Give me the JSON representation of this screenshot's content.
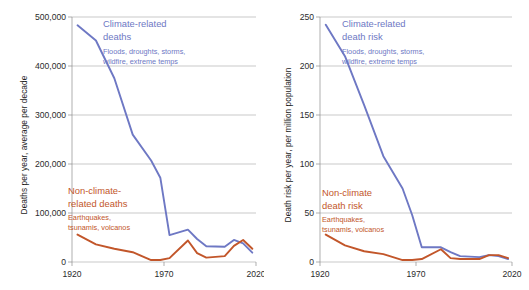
{
  "figure": {
    "background": "#ffffff",
    "colors": {
      "climate": "#6E78C4",
      "nonclimate": "#C2562A",
      "grid": "#a6a6a6",
      "axis": "#8c8c8c",
      "text": "#2b2b2b"
    }
  },
  "chart_data": [
    {
      "type": "line",
      "title": "",
      "xlabel": "",
      "ylabel": "Deaths per year, average per decade",
      "xlim": [
        1920,
        2020
      ],
      "ylim": [
        0,
        500000
      ],
      "xticks": [
        1920,
        1970,
        2020
      ],
      "xticklabels": [
        "1920",
        "1970",
        "2020"
      ],
      "yticks": [
        0,
        100000,
        200000,
        300000,
        400000,
        500000
      ],
      "yticklabels": [
        "0",
        "100,000",
        "200,000",
        "300,000",
        "400,000",
        "500,000"
      ],
      "grid": true,
      "legend_position": "inline-annotation",
      "x": [
        1923,
        1933,
        1943,
        1953,
        1963,
        1968,
        1973,
        1983,
        1988,
        1993,
        2003,
        2008,
        2013,
        2018
      ],
      "series": [
        {
          "name": "Climate-related deaths",
          "color": "#6E78C4",
          "values": [
            483000,
            452000,
            375000,
            260000,
            207000,
            172000,
            55000,
            66000,
            47000,
            32000,
            31000,
            45000,
            38000,
            19000
          ]
        },
        {
          "name": "Non-climate-related deaths",
          "color": "#C2562A",
          "values": [
            56000,
            36000,
            27000,
            20000,
            4000,
            4000,
            8000,
            44000,
            18000,
            9000,
            12000,
            33000,
            45000,
            27000
          ]
        }
      ],
      "annotations": [
        {
          "name": "climate-annotation",
          "title_lines": [
            "Climate-related",
            "deaths"
          ],
          "subtitle_lines": [
            "Floods, droughts, storms,",
            "wildfire, extreme temps"
          ],
          "color": "#6E78C4"
        },
        {
          "name": "nonclimate-annotation",
          "title_lines": [
            "Non-climate-",
            "related deaths"
          ],
          "subtitle_lines": [
            "Earthquakes,",
            "tsunamis, volcanos"
          ],
          "color": "#C2562A"
        }
      ]
    },
    {
      "type": "line",
      "title": "",
      "xlabel": "",
      "ylabel": "Death risk per year, per million population",
      "xlim": [
        1920,
        2020
      ],
      "ylim": [
        0,
        250
      ],
      "xticks": [
        1920,
        1970,
        2020
      ],
      "xticklabels": [
        "1920",
        "1970",
        "2020"
      ],
      "yticks": [
        0,
        50,
        100,
        150,
        200,
        250
      ],
      "yticklabels": [
        "0",
        "50",
        "100",
        "150",
        "200",
        "250"
      ],
      "grid": true,
      "legend_position": "inline-annotation",
      "x": [
        1923,
        1933,
        1943,
        1953,
        1963,
        1968,
        1973,
        1983,
        1988,
        1993,
        2003,
        2008,
        2013,
        2018
      ],
      "series": [
        {
          "name": "Climate-related death risk",
          "color": "#6E78C4",
          "values": [
            242,
            210,
            160,
            108,
            75,
            48,
            15,
            15,
            10,
            6,
            5,
            7,
            6,
            3
          ]
        },
        {
          "name": "Non-climate death risk",
          "color": "#C2562A",
          "values": [
            28,
            17,
            11,
            8,
            2,
            2,
            3,
            13,
            4,
            3,
            3,
            7,
            7,
            4
          ]
        }
      ],
      "annotations": [
        {
          "name": "climate-annotation",
          "title_lines": [
            "Climate-related",
            "death risk"
          ],
          "subtitle_lines": [
            "Floods, droughts, storms,",
            "wildfire, extreme temps"
          ],
          "color": "#6E78C4"
        },
        {
          "name": "nonclimate-annotation",
          "title_lines": [
            "Non-climate",
            "death risk"
          ],
          "subtitle_lines": [
            "Earthquakes,",
            "tsunamis, volcanos"
          ],
          "color": "#C2562A"
        }
      ]
    }
  ]
}
